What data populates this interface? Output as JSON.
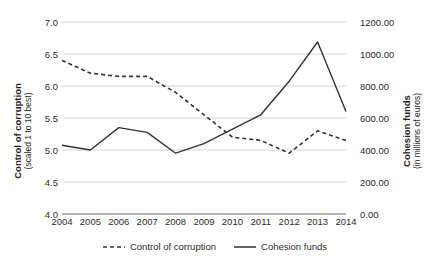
{
  "chart_data": {
    "type": "line",
    "title": "",
    "xlabel": "",
    "categories": [
      "2004",
      "2005",
      "2006",
      "2007",
      "2008",
      "2009",
      "2010",
      "2011",
      "2012",
      "2013",
      "2014"
    ],
    "grid": true,
    "legend_position": "bottom",
    "axes": {
      "left": {
        "label_main": "Control of corruption",
        "label_sub": "(scaled 1 to 10 best)",
        "ylim": [
          4.0,
          7.0
        ],
        "ticks": [
          "4.0",
          "4.5",
          "5.0",
          "5.5",
          "6.0",
          "6.5",
          "7.0"
        ],
        "tick_values": [
          4.0,
          4.5,
          5.0,
          5.5,
          6.0,
          6.5,
          7.0
        ]
      },
      "right": {
        "label_main": "Cohesion funds",
        "label_sub": "(in millions of euros)",
        "ylim": [
          0.0,
          1200.0
        ],
        "ticks": [
          "0.00",
          "200.00",
          "400.00",
          "600.00",
          "800.00",
          "1000.00",
          "1200.00"
        ],
        "tick_values": [
          0,
          200,
          400,
          600,
          800,
          1000,
          1200
        ]
      }
    },
    "series": [
      {
        "name": "Control of corruption",
        "axis": "left",
        "style": "dashed",
        "color": "#333333",
        "values": [
          6.4,
          6.2,
          6.15,
          6.15,
          5.9,
          5.55,
          5.2,
          5.15,
          4.95,
          5.3,
          5.15
        ]
      },
      {
        "name": "Cohesion funds",
        "axis": "right",
        "style": "solid",
        "color": "#333333",
        "values": [
          430,
          400,
          540,
          510,
          380,
          440,
          530,
          620,
          830,
          1075,
          640
        ]
      }
    ]
  },
  "legend": {
    "items": [
      {
        "label": "Control of corruption",
        "style": "dashed"
      },
      {
        "label": "Cohesion funds",
        "style": "solid"
      }
    ]
  }
}
